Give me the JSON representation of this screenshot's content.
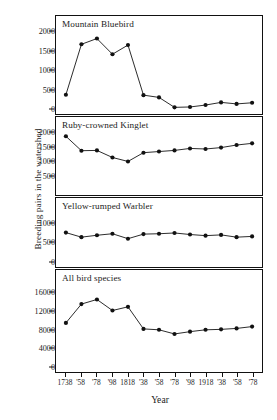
{
  "figure": {
    "ylabel": "Breeding pairs in the watershed",
    "xlabel": "Year",
    "xtick_labels": [
      "1738",
      "'58",
      "'78",
      "'98",
      "1818",
      "'38",
      "'58",
      "'78",
      "'98",
      "1918",
      "'38",
      "'58",
      "'78"
    ],
    "line_color": "#111111",
    "marker_color": "#111111",
    "background_color": "#ffffff",
    "axis_color": "#111111"
  },
  "chart_data": [
    {
      "type": "line",
      "title": "Mountain Bluebird",
      "xlabel": "Year",
      "ylabel": "Breeding pairs in the watershed",
      "x": [
        1738,
        1758,
        1778,
        1798,
        1818,
        1838,
        1858,
        1878,
        1898,
        1918,
        1938,
        1958,
        1978
      ],
      "categories": [
        "1738",
        "'58",
        "'78",
        "'98",
        "1818",
        "'38",
        "'58",
        "'78",
        "'98",
        "1918",
        "'38",
        "'58",
        "'78"
      ],
      "values": [
        350,
        1670,
        1820,
        1410,
        1650,
        340,
        280,
        20,
        30,
        80,
        150,
        110,
        140
      ],
      "ylim": [
        0,
        2000
      ],
      "yticks": [
        0,
        500,
        1000,
        1500,
        2000
      ],
      "ytick_labels": [
        "0",
        "500",
        "1000",
        "1500",
        "2000"
      ],
      "grid": false,
      "legend": "none"
    },
    {
      "type": "line",
      "title": "Ruby-crowned Kinglet",
      "xlabel": "Year",
      "ylabel": "Breeding pairs in the watershed",
      "x": [
        1738,
        1758,
        1778,
        1798,
        1818,
        1838,
        1858,
        1878,
        1898,
        1918,
        1938,
        1958,
        1978
      ],
      "categories": [
        "1738",
        "'58",
        "'78",
        "'98",
        "1818",
        "'38",
        "'58",
        "'78",
        "'98",
        "1918",
        "'38",
        "'58",
        "'78"
      ],
      "values": [
        1870,
        1360,
        1370,
        1120,
        980,
        1290,
        1330,
        1370,
        1440,
        1420,
        1470,
        1560,
        1620
      ],
      "ylim": [
        0,
        2000
      ],
      "yticks": [
        500,
        1000,
        1500,
        2000
      ],
      "ytick_labels": [
        "500",
        "1000",
        "1500",
        "2000"
      ],
      "grid": false,
      "legend": "none"
    },
    {
      "type": "line",
      "title": "Yellow-rumped Warbler",
      "xlabel": "Year",
      "ylabel": "Breeding pairs in the watershed",
      "x": [
        1738,
        1758,
        1778,
        1798,
        1818,
        1838,
        1858,
        1878,
        1898,
        1918,
        1938,
        1958,
        1978
      ],
      "categories": [
        "1738",
        "'58",
        "'78",
        "'98",
        "1818",
        "'38",
        "'58",
        "'78",
        "'98",
        "1918",
        "'38",
        "'58",
        "'78"
      ],
      "values": [
        750,
        630,
        680,
        720,
        590,
        710,
        720,
        740,
        700,
        670,
        690,
        630,
        650
      ],
      "ylim": [
        0,
        1250
      ],
      "yticks": [
        0,
        500,
        1000
      ],
      "ytick_labels": [
        "0",
        "500",
        "1000"
      ],
      "grid": false,
      "legend": "none"
    },
    {
      "type": "line",
      "title": "All bird species",
      "xlabel": "Year",
      "ylabel": "Breeding pairs in the watershed",
      "x": [
        1738,
        1758,
        1778,
        1798,
        1818,
        1838,
        1858,
        1878,
        1898,
        1918,
        1938,
        1958,
        1978
      ],
      "categories": [
        "1738",
        "'58",
        "'78",
        "'98",
        "1818",
        "'38",
        "'58",
        "'78",
        "'98",
        "1918",
        "'38",
        "'58",
        "'78"
      ],
      "values": [
        9400,
        13500,
        14500,
        12100,
        12900,
        8100,
        7900,
        7000,
        7500,
        7900,
        8000,
        8200,
        8600
      ],
      "ylim": [
        0,
        17500
      ],
      "yticks": [
        0,
        4000,
        8000,
        12000,
        16000
      ],
      "ytick_labels": [
        "0",
        "4000",
        "8000",
        "12000",
        "16000"
      ],
      "grid": false,
      "legend": "none"
    }
  ]
}
